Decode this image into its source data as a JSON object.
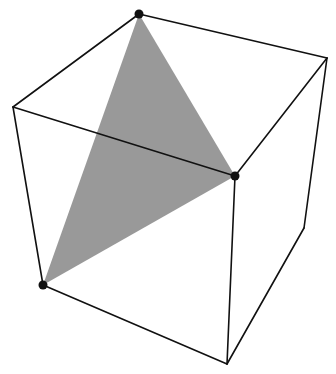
{
  "diagram": {
    "title": "",
    "background": "#ffffff",
    "edge_color": "#111111",
    "edge_width": 1.6,
    "vertex_color": "#111111",
    "vertex_radius": 4.5,
    "triangle_fill": "#999999",
    "vertices": {
      "top_back_left": [
        139,
        14
      ],
      "top_back_right": [
        327,
        58
      ],
      "top_front_left": [
        13,
        107
      ],
      "top_front_right": [
        235,
        176
      ],
      "bottom_front_left": [
        43,
        285
      ],
      "bottom_back_right": [
        304,
        228
      ],
      "bottom_front_right": [
        227,
        364
      ]
    },
    "edges": [
      [
        "top_back_left",
        "top_back_right"
      ],
      [
        "top_back_left",
        "top_front_left"
      ],
      [
        "top_front_left",
        "top_front_right"
      ],
      [
        "top_back_right",
        "top_front_right"
      ],
      [
        "top_front_left",
        "bottom_front_left"
      ],
      [
        "top_front_right",
        "bottom_front_right"
      ],
      [
        "top_back_right",
        "bottom_back_right"
      ],
      [
        "bottom_front_left",
        "bottom_front_right"
      ],
      [
        "bottom_front_right",
        "bottom_back_right"
      ]
    ],
    "triangle": [
      "top_back_left",
      "top_front_right",
      "bottom_front_left"
    ],
    "marked_vertices": [
      "top_back_left",
      "top_front_right",
      "bottom_front_left"
    ]
  }
}
